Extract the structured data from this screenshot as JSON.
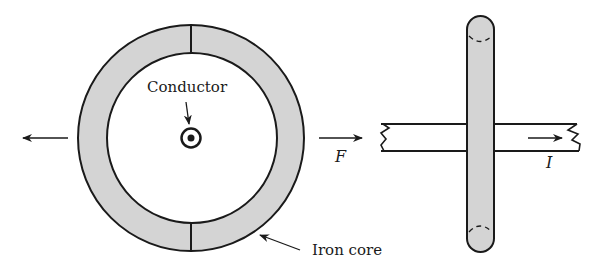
{
  "diagram": {
    "labels": {
      "conductor": "Conductor",
      "iron_core": "Iron core",
      "force": "F",
      "current": "I"
    },
    "colors": {
      "core_fill": "#d4d4d4",
      "stroke": "#1a1a1a",
      "background": "#ffffff"
    },
    "symbols": {
      "conductor_direction": "current-out-of-page-dot"
    },
    "arrows": {
      "left_force": "left",
      "force_F": "right",
      "current_I": "right"
    }
  }
}
